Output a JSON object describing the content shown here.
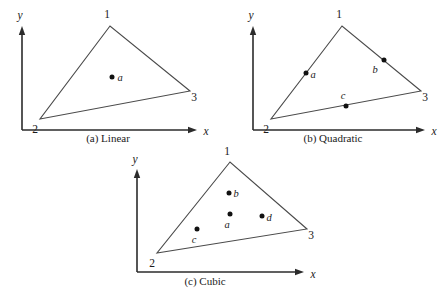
{
  "figure": {
    "name": "triangular-element-node-layouts",
    "background": "#ffffff",
    "line_color": "#4a4a4a",
    "axis_color": "#2b2b2b",
    "dot_color": "#111111"
  },
  "panels": [
    {
      "id": "a",
      "caption": "(a) Linear",
      "caption_pos": {
        "x": 108,
        "y": 142
      },
      "axis": {
        "x_label": "x",
        "y_label": "y",
        "x_label_pos": {
          "x": 206,
          "y": 135
        },
        "y_label_pos": {
          "x": 20,
          "y": 19
        },
        "origin": {
          "x": 22,
          "y": 130
        },
        "x_end": {
          "x": 196,
          "y": 130
        },
        "y_end": {
          "x": 22,
          "y": 27
        }
      },
      "triangle": {
        "v1": {
          "x": 110,
          "y": 26
        },
        "v2": {
          "x": 40,
          "y": 119
        },
        "v3": {
          "x": 190,
          "y": 91
        }
      },
      "vertices": [
        {
          "label": "1",
          "x": 107,
          "y": 18
        },
        {
          "label": "2",
          "x": 35,
          "y": 133
        },
        {
          "label": "3",
          "x": 194,
          "y": 101
        }
      ],
      "points": [
        {
          "label": "a",
          "x": 112,
          "y": 77,
          "label_x": 120,
          "label_y": 81
        }
      ]
    },
    {
      "id": "b",
      "caption": "(b) Quadratic",
      "caption_pos": {
        "x": 333,
        "y": 142
      },
      "axis": {
        "x_label": "x",
        "y_label": "y",
        "x_label_pos": {
          "x": 434,
          "y": 135
        },
        "y_label_pos": {
          "x": 251,
          "y": 19
        },
        "origin": {
          "x": 253,
          "y": 130
        },
        "x_end": {
          "x": 424,
          "y": 130
        },
        "y_end": {
          "x": 253,
          "y": 27
        }
      },
      "triangle": {
        "v1": {
          "x": 342,
          "y": 26
        },
        "v2": {
          "x": 271,
          "y": 119
        },
        "v3": {
          "x": 421,
          "y": 91
        }
      },
      "vertices": [
        {
          "label": "1",
          "x": 339,
          "y": 18
        },
        {
          "label": "2",
          "x": 266,
          "y": 133
        },
        {
          "label": "3",
          "x": 425,
          "y": 101
        }
      ],
      "points": [
        {
          "label": "a",
          "x": 306,
          "y": 73,
          "label_x": 313,
          "label_y": 78
        },
        {
          "label": "b",
          "x": 384,
          "y": 60,
          "label_x": 375,
          "label_y": 73
        },
        {
          "label": "c",
          "x": 346,
          "y": 106,
          "label_x": 343,
          "label_y": 99
        }
      ]
    },
    {
      "id": "c",
      "caption": "(c) Cubic",
      "caption_pos": {
        "x": 205,
        "y": 285
      },
      "axis": {
        "x_label": "x",
        "y_label": "y",
        "x_label_pos": {
          "x": 313,
          "y": 278
        },
        "y_label_pos": {
          "x": 135,
          "y": 163
        },
        "origin": {
          "x": 137,
          "y": 272
        },
        "x_end": {
          "x": 303,
          "y": 272
        },
        "y_end": {
          "x": 137,
          "y": 170
        }
      },
      "triangle": {
        "v1": {
          "x": 230,
          "y": 162
        },
        "v2": {
          "x": 157,
          "y": 253
        },
        "v3": {
          "x": 307,
          "y": 229
        }
      },
      "vertices": [
        {
          "label": "1",
          "x": 227,
          "y": 155
        },
        {
          "label": "2",
          "x": 152,
          "y": 267
        },
        {
          "label": "3",
          "x": 311,
          "y": 239
        }
      ],
      "points": [
        {
          "label": "b",
          "x": 229,
          "y": 193,
          "label_x": 236,
          "label_y": 197
        },
        {
          "label": "a",
          "x": 230,
          "y": 214,
          "label_x": 227,
          "label_y": 228
        },
        {
          "label": "d",
          "x": 262,
          "y": 216,
          "label_x": 269,
          "label_y": 221
        },
        {
          "label": "c",
          "x": 197,
          "y": 229,
          "label_x": 194,
          "label_y": 243
        }
      ]
    }
  ]
}
